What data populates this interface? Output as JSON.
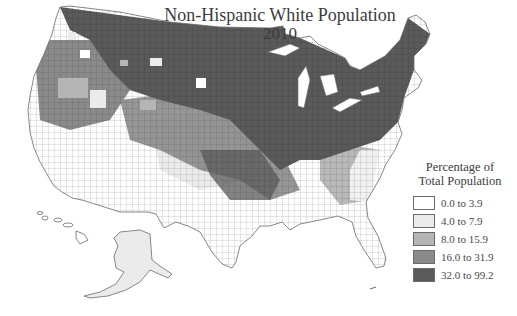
{
  "title": "Non-Hispanic White Population",
  "subtitle": "2010",
  "map": {
    "subject": "Non-Hispanic White share of total population by county",
    "region": "United States (contiguous, with Alaska and Hawaii insets)",
    "unit": "county",
    "high_share_regions": [
      "Northeast",
      "Midwest",
      "Appalachia",
      "Northern Plains",
      "Mountain West (north)",
      "Pacific Northwest"
    ],
    "low_share_regions": [
      "Southwest",
      "Texas",
      "Deep South",
      "Southern California",
      "Hawaii"
    ]
  },
  "legend": {
    "title_line1": "Percentage of",
    "title_line2": "Total Population",
    "classes": [
      {
        "label": "0.0 to 3.9",
        "min": 0.0,
        "max": 3.9,
        "color": "#ffffff"
      },
      {
        "label": "4.0 to 7.9",
        "min": 4.0,
        "max": 7.9,
        "color": "#ebebeb"
      },
      {
        "label": "8.0 to 15.9",
        "min": 8.0,
        "max": 15.9,
        "color": "#b5b5b5"
      },
      {
        "label": "16.0 to 31.9",
        "min": 16.0,
        "max": 31.9,
        "color": "#8a8a8a"
      },
      {
        "label": "32.0 to 99.2",
        "min": 32.0,
        "max": 99.2,
        "color": "#5a5a5a"
      }
    ]
  },
  "colors": {
    "outline": "#6a6a6a",
    "background": "#ffffff",
    "text": "#3c3c3c"
  }
}
